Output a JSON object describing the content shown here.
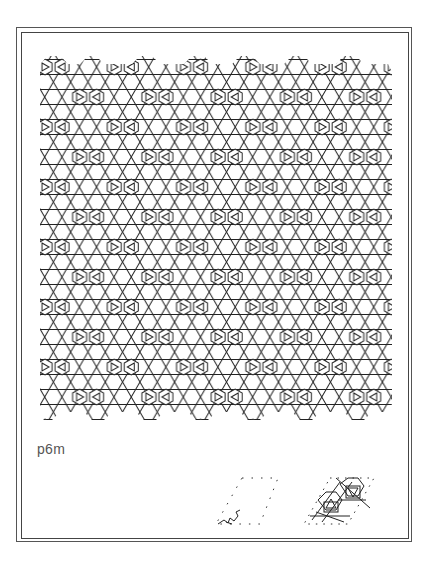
{
  "figure": {
    "group_label": "p6m",
    "line_color": "#222222",
    "frame_color": "#555555",
    "label_color": "#555555",
    "pattern": {
      "description": "tiled wallpaper pattern with triangular grid lines and hexagon-triangle motifs",
      "icon": "wallpaper-pattern-icon"
    },
    "insets": [
      {
        "name": "fundamental-region",
        "icon": "dotted-parallelogram-with-motif-icon"
      },
      {
        "name": "unit-cell",
        "icon": "dotted-parallelogram-with-pattern-icon"
      }
    ]
  }
}
